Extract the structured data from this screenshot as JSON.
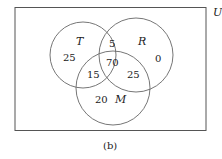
{
  "diagram": {
    "type": "venn",
    "universe_label": "U",
    "caption": "(b)",
    "sets": [
      {
        "label": "T"
      },
      {
        "label": "R"
      },
      {
        "label": "M"
      }
    ],
    "regions": {
      "T_only": "25",
      "R_only": "0",
      "M_only": "20",
      "T_and_R_only": "5",
      "T_and_M_only": "15",
      "R_and_M_only": "25",
      "T_R_M": "70"
    }
  }
}
